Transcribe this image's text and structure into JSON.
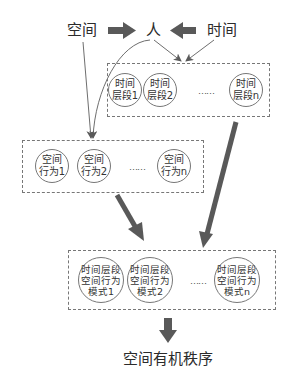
{
  "top": {
    "space_label": "空间",
    "person_label": "人",
    "time_label": "时间"
  },
  "time_periods": {
    "nodes": [
      {
        "line1": "时间",
        "line2": "层段1"
      },
      {
        "line1": "时间",
        "line2": "层段2"
      },
      {
        "line1": "时间",
        "line2": "层段n"
      }
    ],
    "ellipsis": "……"
  },
  "spatial_behaviors": {
    "nodes": [
      {
        "line1": "空间",
        "line2": "行为1"
      },
      {
        "line1": "空间",
        "line2": "行为2"
      },
      {
        "line1": "空间",
        "line2": "行为n"
      }
    ],
    "ellipsis": "……"
  },
  "patterns": {
    "nodes": [
      {
        "line1": "时间层段",
        "line2": "空间行为",
        "line3": "模式1"
      },
      {
        "line1": "时间层段",
        "line2": "空间行为",
        "line3": "模式2"
      },
      {
        "line1": "时间层段",
        "line2": "空间行为",
        "line3": "模式n"
      }
    ],
    "ellipsis": "……"
  },
  "result": {
    "label": "空间有机秩序"
  },
  "colors": {
    "thick_arrow": "#595959",
    "thin_line": "#6e6e6e",
    "dashed_border": "#777777"
  }
}
